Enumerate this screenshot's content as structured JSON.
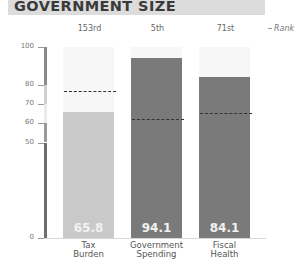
{
  "header": {
    "title": "GOVERNMENT SIZE"
  },
  "legend": {
    "rank_label": "Rank"
  },
  "colors": {
    "header_band": "#dcdcdc",
    "bar_light": "#c9c9c9",
    "bar_dark": "#7a7a7a",
    "ref_line": "#333333"
  },
  "chart_data": {
    "type": "bar",
    "title": "GOVERNMENT SIZE",
    "xlabel": "",
    "ylabel": "",
    "ylim": [
      0,
      100
    ],
    "yticks": [
      0,
      50,
      60,
      70,
      80,
      100
    ],
    "categories": [
      "Tax Burden",
      "Government Spending",
      "Fiscal Health"
    ],
    "category_lines": [
      [
        "Tax",
        "Burden"
      ],
      [
        "Government",
        "Spending"
      ],
      [
        "Fiscal",
        "Health"
      ]
    ],
    "values": [
      65.8,
      94.1,
      84.1
    ],
    "value_labels": [
      "65.8",
      "94.1",
      "84.1"
    ],
    "ranks": [
      "153rd",
      "5th",
      "71st"
    ],
    "reference_values": [
      77.0,
      62.3,
      65.7
    ],
    "reference_style": "dashed line",
    "legend": [
      "Rank"
    ],
    "legend_position": "top-right",
    "grid": false,
    "axis_bands": [
      {
        "from": 80,
        "to": 100,
        "color": "#8a8a8a"
      },
      {
        "from": 70,
        "to": 80,
        "color": "#cfcfcf"
      },
      {
        "from": 60,
        "to": 70,
        "color": "#ebebeb"
      },
      {
        "from": 50,
        "to": 60,
        "color": "#9a9a9a"
      },
      {
        "from": 0,
        "to": 50,
        "color": "#6e6e6e"
      }
    ]
  }
}
